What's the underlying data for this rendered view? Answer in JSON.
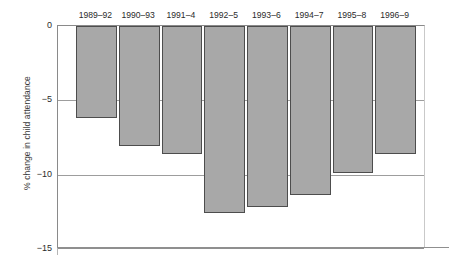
{
  "chart_data": {
    "type": "bar",
    "title": "",
    "xlabel": "",
    "ylabel": "% change in child attendance",
    "categories": [
      "1989–92",
      "1990–93",
      "1991–4",
      "1992–5",
      "1993–6",
      "1994–7",
      "1995–8",
      "1996–9"
    ],
    "values": [
      -6.2,
      -8.1,
      -8.6,
      -12.6,
      -12.2,
      -11.4,
      -9.9,
      -8.6
    ],
    "ylim": [
      -15,
      0
    ],
    "yticks": [
      0,
      -5,
      -10,
      -15
    ],
    "ytick_labels": [
      "0",
      "−5",
      "−10",
      "−15"
    ],
    "grid": true,
    "grid_axis": "y",
    "legend": false,
    "category_label_position": "top",
    "bar_color": "#a8a8a8",
    "bar_edge_color": "#4d4d4d",
    "axis_color": "#8a8a8a",
    "grid_color": "#9d9d9d",
    "background": "#ffffff"
  }
}
